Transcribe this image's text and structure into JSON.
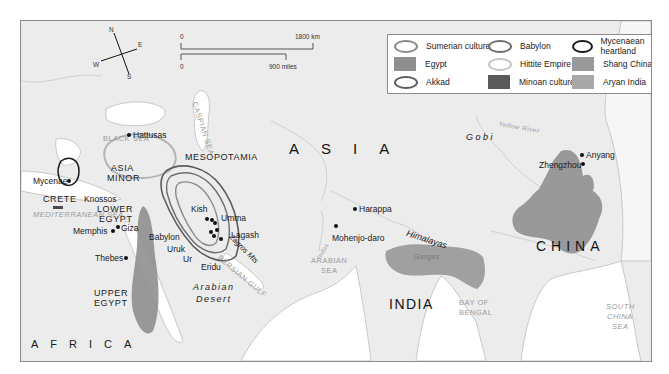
{
  "legend": {
    "items": [
      {
        "label": "Sumerian culture",
        "kind": "ring",
        "color": "#8a8a8a"
      },
      {
        "label": "Babylon",
        "kind": "ring",
        "color": "#6e6e6e"
      },
      {
        "label": "Mycenaean heartland",
        "kind": "ring",
        "color": "#1a1a1a"
      },
      {
        "label": "Egypt",
        "kind": "fill",
        "color": "#8f8f8f"
      },
      {
        "label": "Hittite Empire",
        "kind": "ring",
        "color": "#b9b9b9"
      },
      {
        "label": "Shang China",
        "kind": "fill",
        "color": "#999999"
      },
      {
        "label": "Akkad",
        "kind": "ring",
        "color": "#5d5d5d"
      },
      {
        "label": "Minoan culture",
        "kind": "fill",
        "color": "#5a5a5a"
      },
      {
        "label": "Aryan India",
        "kind": "fill",
        "color": "#a8a8a8"
      }
    ]
  },
  "scale_bar": {
    "km_start": "0",
    "km_end": "1800 km",
    "miles_start": "0",
    "miles_end": "900 miles"
  },
  "compass": {
    "n": "N",
    "e": "E",
    "s": "S",
    "w": "W"
  },
  "labels": {
    "continents": {
      "asia": "ASIA",
      "africa": "AFRICA"
    },
    "countries": {
      "india": "INDIA",
      "china": "CHINA"
    },
    "regions": {
      "asia_minor_1": "ASIA",
      "asia_minor_2": "MINOR",
      "mesopotamia": "MESOPOTAMIA",
      "lower_egypt_1": "LOWER",
      "lower_egypt_2": "EGYPT",
      "upper_egypt_1": "UPPER",
      "upper_egypt_2": "EGYPT",
      "crete": "CRETE"
    },
    "seas": {
      "black_sea": "BLACK SEA",
      "caspian_sea": "CASPIAN SEA",
      "aegean_sea": "AEGEAN SEA",
      "mediterranean_sea": "MEDITERRANEAN SEA",
      "red_sea": "RED SEA",
      "persian_gulf": "PERSIAN GULF",
      "arabian_sea_1": "ARABIAN",
      "arabian_sea_2": "SEA",
      "bay_of_bengal_1": "BAY OF",
      "bay_of_bengal_2": "BENGAL",
      "south_china_sea_1": "SOUTH",
      "south_china_sea_2": "CHINA",
      "south_china_sea_3": "SEA"
    },
    "physical": {
      "gobi": "G o b i",
      "himalayas": "Himalayas",
      "zagros": "Zagros Mts",
      "arabian_desert_1": "Arabian",
      "arabian_desert_2": "Desert",
      "yellow_river": "Yellow River",
      "yangtze": "Yangtze",
      "indus": "Indus",
      "ganges": "Ganges"
    },
    "cities": {
      "hattusas": "Hattusas",
      "mycenae": "Mycenae",
      "knossos": "Knossos",
      "memphis": "Memphis",
      "giza": "Giza",
      "thebes": "Thebes",
      "babylon": "Babylon",
      "kish": "Kish",
      "umma": "Umma",
      "lagash": "Lagash",
      "uruk": "Uruk",
      "ur": "Ur",
      "eridu": "Eridu",
      "harappa": "Harappa",
      "mohenjo_daro": "Mohenjo-daro",
      "anyang": "Anyang",
      "zhengzhou": "Zhengzhou"
    }
  }
}
